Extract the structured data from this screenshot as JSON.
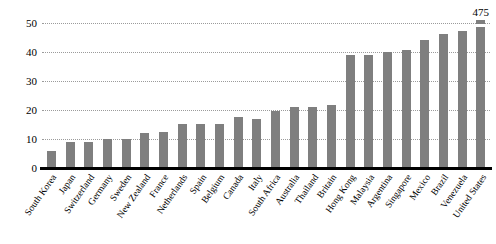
{
  "chart_data": {
    "type": "bar",
    "title": "",
    "subtitle": "",
    "xlabel": "",
    "ylabel": "",
    "ylim": [
      0,
      55
    ],
    "yticks": [
      0,
      10,
      20,
      30,
      40,
      50
    ],
    "grid": true,
    "legend": "none",
    "bar_color": "#7f7f7f",
    "axis_color": "#000000",
    "categories": [
      "South Korea",
      "Japan",
      "Switzerland",
      "Germany",
      "Sweden",
      "New Zealand",
      "France",
      "Netherlands",
      "Spain",
      "Belgium",
      "Canada",
      "Italy",
      "South Africa",
      "Australia",
      "Thailand",
      "Britain",
      "Hong Kong",
      "Malaysia",
      "Argentina",
      "Singapore",
      "Mexico",
      "Brazil",
      "Venezuela",
      "United States"
    ],
    "values": [
      6,
      9,
      9,
      10,
      10,
      12,
      12.5,
      15,
      15,
      15,
      17.5,
      17,
      19.5,
      21,
      21,
      21.5,
      39,
      39,
      40,
      40.5,
      44,
      46,
      47,
      475
    ],
    "annotations": [
      {
        "category": "United States",
        "label": "475",
        "note": "bar truncated; axis break shown"
      }
    ]
  }
}
